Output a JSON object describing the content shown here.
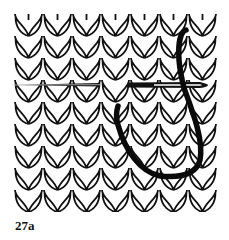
{
  "figure": {
    "caption": "27a",
    "colors": {
      "background": "#ffffff",
      "ink": "#111111",
      "yarn": "#0a0a0a"
    },
    "knit_grid": {
      "x_start": 14,
      "x_end": 217,
      "y_start": 14,
      "y_end": 212,
      "columns": 7,
      "stitch_height": 22
    },
    "needle": {
      "y": 85,
      "left_segment": [
        10,
        100
      ],
      "right_segment": [
        128,
        208
      ]
    }
  }
}
